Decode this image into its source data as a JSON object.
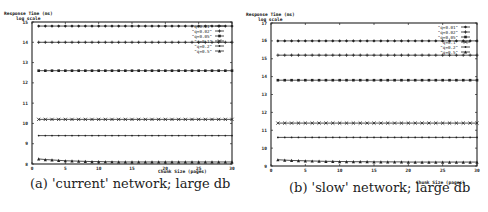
{
  "chart_data": [
    {
      "type": "line",
      "caption": "(a) 'current' network; large db",
      "ylabel_line1": "Response Time (ms)",
      "ylabel_line2": "log scale",
      "xlabel": "Chunk Size (pages)",
      "xlim": [
        0,
        30
      ],
      "ylim": [
        8,
        15
      ],
      "xticks": [
        0,
        5,
        10,
        15,
        20,
        25,
        30
      ],
      "yticks": [
        8,
        9,
        10,
        11,
        12,
        13,
        14,
        15
      ],
      "legend_position": "top-right",
      "x": [
        1,
        2,
        3,
        4,
        5,
        6,
        7,
        8,
        9,
        10,
        11,
        12,
        13,
        14,
        15,
        16,
        17,
        18,
        19,
        20,
        21,
        22,
        23,
        24,
        25,
        26,
        27,
        28,
        29,
        30
      ],
      "series": [
        {
          "name": "\"q=0.01\"",
          "values": [
            14.8,
            14.8,
            14.8,
            14.8,
            14.8,
            14.8,
            14.8,
            14.8,
            14.8,
            14.8,
            14.8,
            14.8,
            14.8,
            14.8,
            14.8,
            14.8,
            14.8,
            14.8,
            14.8,
            14.8,
            14.8,
            14.8,
            14.8,
            14.8,
            14.8,
            14.8,
            14.8,
            14.8,
            14.8,
            14.8
          ]
        },
        {
          "name": "\"q=0.02\"",
          "values": [
            14.0,
            14.0,
            14.0,
            14.0,
            14.0,
            14.0,
            14.0,
            14.0,
            14.0,
            14.0,
            14.0,
            14.0,
            14.0,
            14.0,
            14.0,
            14.0,
            14.0,
            14.0,
            14.0,
            14.0,
            14.0,
            14.0,
            14.0,
            14.0,
            14.0,
            14.0,
            14.0,
            14.0,
            14.0,
            14.0
          ]
        },
        {
          "name": "\"q=0.05\"",
          "values": [
            12.6,
            12.6,
            12.6,
            12.6,
            12.6,
            12.6,
            12.6,
            12.6,
            12.6,
            12.6,
            12.6,
            12.6,
            12.6,
            12.6,
            12.6,
            12.6,
            12.6,
            12.6,
            12.6,
            12.6,
            12.6,
            12.6,
            12.6,
            12.6,
            12.6,
            12.6,
            12.6,
            12.6,
            12.6,
            12.6
          ]
        },
        {
          "name": "\"q=0.1\"",
          "values": [
            10.2,
            10.2,
            10.2,
            10.2,
            10.2,
            10.2,
            10.2,
            10.2,
            10.2,
            10.2,
            10.2,
            10.2,
            10.2,
            10.2,
            10.2,
            10.2,
            10.2,
            10.2,
            10.2,
            10.2,
            10.2,
            10.2,
            10.2,
            10.2,
            10.2,
            10.2,
            10.2,
            10.2,
            10.2,
            10.2
          ]
        },
        {
          "name": "\"q=0.2\"",
          "values": [
            9.4,
            9.4,
            9.4,
            9.4,
            9.4,
            9.4,
            9.4,
            9.4,
            9.4,
            9.4,
            9.4,
            9.4,
            9.4,
            9.4,
            9.4,
            9.4,
            9.4,
            9.4,
            9.4,
            9.4,
            9.4,
            9.4,
            9.4,
            9.4,
            9.4,
            9.4,
            9.4,
            9.4,
            9.4,
            9.4
          ]
        },
        {
          "name": "\"q=0.5\"",
          "values": [
            8.25,
            8.22,
            8.2,
            8.18,
            8.16,
            8.15,
            8.14,
            8.13,
            8.12,
            8.12,
            8.11,
            8.11,
            8.1,
            8.1,
            8.1,
            8.1,
            8.1,
            8.1,
            8.1,
            8.1,
            8.1,
            8.1,
            8.1,
            8.1,
            8.1,
            8.1,
            8.1,
            8.1,
            8.1,
            8.1
          ]
        }
      ]
    },
    {
      "type": "line",
      "caption": "(b) 'slow' network; large db",
      "ylabel_line1": "Response Time (ms)",
      "ylabel_line2": "log scale",
      "xlabel": "Chunk Size (pages)",
      "xlim": [
        0,
        30
      ],
      "ylim": [
        9,
        17
      ],
      "xticks": [
        0,
        5,
        10,
        15,
        20,
        25,
        30
      ],
      "yticks": [
        9,
        10,
        11,
        12,
        13,
        14,
        15,
        16,
        17
      ],
      "legend_position": "top-right",
      "x": [
        1,
        2,
        3,
        4,
        5,
        6,
        7,
        8,
        9,
        10,
        11,
        12,
        13,
        14,
        15,
        16,
        17,
        18,
        19,
        20,
        21,
        22,
        23,
        24,
        25,
        26,
        27,
        28,
        29,
        30
      ],
      "series": [
        {
          "name": "\"q=0.01\"",
          "values": [
            16.0,
            16.0,
            16.0,
            16.0,
            16.0,
            16.0,
            16.0,
            16.0,
            16.0,
            16.0,
            16.0,
            16.0,
            16.0,
            16.0,
            16.0,
            16.0,
            16.0,
            16.0,
            16.0,
            16.0,
            16.0,
            16.0,
            16.0,
            16.0,
            16.0,
            16.0,
            16.0,
            16.0,
            16.0,
            16.0
          ]
        },
        {
          "name": "\"q=0.02\"",
          "values": [
            15.2,
            15.2,
            15.2,
            15.2,
            15.2,
            15.2,
            15.2,
            15.2,
            15.2,
            15.2,
            15.2,
            15.2,
            15.2,
            15.2,
            15.2,
            15.2,
            15.2,
            15.2,
            15.2,
            15.2,
            15.2,
            15.2,
            15.2,
            15.2,
            15.2,
            15.2,
            15.2,
            15.2,
            15.2,
            15.2
          ]
        },
        {
          "name": "\"q=0.05\"",
          "values": [
            13.8,
            13.8,
            13.8,
            13.8,
            13.8,
            13.8,
            13.8,
            13.8,
            13.8,
            13.8,
            13.8,
            13.8,
            13.8,
            13.8,
            13.8,
            13.8,
            13.8,
            13.8,
            13.8,
            13.8,
            13.8,
            13.8,
            13.8,
            13.8,
            13.8,
            13.8,
            13.8,
            13.8,
            13.8,
            13.8
          ]
        },
        {
          "name": "\"q=0.1\"",
          "values": [
            11.4,
            11.4,
            11.4,
            11.4,
            11.4,
            11.4,
            11.4,
            11.4,
            11.4,
            11.4,
            11.4,
            11.4,
            11.4,
            11.4,
            11.4,
            11.4,
            11.4,
            11.4,
            11.4,
            11.4,
            11.4,
            11.4,
            11.4,
            11.4,
            11.4,
            11.4,
            11.4,
            11.4,
            11.4,
            11.4
          ]
        },
        {
          "name": "\"q=0.2\"",
          "values": [
            10.6,
            10.6,
            10.6,
            10.6,
            10.6,
            10.6,
            10.6,
            10.6,
            10.6,
            10.6,
            10.6,
            10.6,
            10.6,
            10.6,
            10.6,
            10.6,
            10.6,
            10.6,
            10.6,
            10.6,
            10.6,
            10.6,
            10.6,
            10.6,
            10.6,
            10.6,
            10.6,
            10.6,
            10.6,
            10.6
          ]
        },
        {
          "name": "\"q=0.5\"",
          "values": [
            9.35,
            9.33,
            9.31,
            9.3,
            9.29,
            9.28,
            9.27,
            9.26,
            9.26,
            9.25,
            9.25,
            9.24,
            9.24,
            9.24,
            9.23,
            9.23,
            9.23,
            9.23,
            9.23,
            9.22,
            9.22,
            9.22,
            9.22,
            9.22,
            9.22,
            9.22,
            9.22,
            9.22,
            9.22,
            9.22
          ]
        }
      ]
    }
  ]
}
